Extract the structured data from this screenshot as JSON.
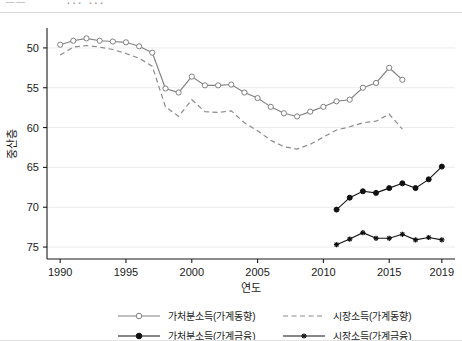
{
  "header": {
    "fragment_left": "──",
    "fragment_right": "··· ···"
  },
  "chart_data": {
    "type": "line",
    "title": "",
    "xlabel": "연도",
    "ylabel": "중산층",
    "xlim": [
      1989,
      2020
    ],
    "ylim": [
      48.5,
      77.5
    ],
    "xticks": [
      1990,
      1995,
      2000,
      2005,
      2010,
      2015,
      2019
    ],
    "yticks": [
      50,
      55,
      60,
      65,
      70,
      75
    ],
    "grid": "horizontal",
    "legend_position": "bottom",
    "series": [
      {
        "name": "가처분소득(가계동향)",
        "marker": "open-circle",
        "line": "solid",
        "color": "#808080",
        "x": [
          1990,
          1991,
          1992,
          1993,
          1994,
          1995,
          1996,
          1997,
          1998,
          1999,
          2000,
          2001,
          2002,
          2003,
          2004,
          2005,
          2006,
          2007,
          2008,
          2009,
          2010,
          2011,
          2012,
          2013,
          2014,
          2015,
          2016
        ],
        "values": [
          75.4,
          75.9,
          76.2,
          75.9,
          75.8,
          75.7,
          75.2,
          74.4,
          69.9,
          69.4,
          71.4,
          70.3,
          70.3,
          70.4,
          69.4,
          68.7,
          67.6,
          66.8,
          66.4,
          67.0,
          67.6,
          68.3,
          68.5,
          70.0,
          70.6,
          72.5,
          71.0
        ]
      },
      {
        "name": "시장소득(가계동향)",
        "marker": "none",
        "line": "dashed",
        "color": "#8a8a8a",
        "x": [
          1990,
          1991,
          1992,
          1993,
          1994,
          1995,
          1996,
          1997,
          1998,
          1999,
          2000,
          2001,
          2002,
          2003,
          2004,
          2005,
          2006,
          2007,
          2008,
          2009,
          2010,
          2011,
          2012,
          2013,
          2014,
          2015,
          2016
        ],
        "values": [
          74.1,
          75.1,
          75.3,
          75.1,
          74.8,
          74.3,
          73.7,
          72.7,
          67.6,
          66.4,
          68.5,
          67.0,
          66.9,
          67.1,
          65.6,
          64.6,
          63.4,
          62.6,
          62.3,
          62.9,
          63.8,
          64.7,
          65.1,
          65.6,
          65.8,
          66.7,
          64.8
        ]
      },
      {
        "name": "가처분소득(가계금융)",
        "marker": "filled-circle",
        "line": "solid",
        "color": "#111111",
        "x": [
          2011,
          2012,
          2013,
          2014,
          2015,
          2016,
          2017,
          2018,
          2019
        ],
        "values": [
          54.7,
          56.2,
          57.0,
          56.8,
          57.4,
          58.0,
          57.4,
          58.5,
          60.1
        ]
      },
      {
        "name": "시장소득(가계금융)",
        "marker": "cross",
        "line": "solid",
        "color": "#111111",
        "x": [
          2011,
          2012,
          2013,
          2014,
          2015,
          2016,
          2017,
          2018,
          2019
        ],
        "values": [
          50.3,
          51.0,
          51.8,
          51.1,
          51.1,
          51.6,
          50.9,
          51.2,
          50.9
        ]
      }
    ]
  },
  "legend": {
    "items": [
      {
        "label": "가처분소득(가계동향)"
      },
      {
        "label": "시장소득(가계동향)"
      },
      {
        "label": "가처분소득(가계금융)"
      },
      {
        "label": "시장소득(가계금융)"
      }
    ]
  },
  "axis": {
    "y_tick_labels": [
      "75",
      "70",
      "65",
      "60",
      "55",
      "50"
    ],
    "x_tick_labels": [
      "1990",
      "1995",
      "2000",
      "2005",
      "2010",
      "2015",
      "2019"
    ],
    "y_title": "중산층",
    "x_title": "연도"
  }
}
